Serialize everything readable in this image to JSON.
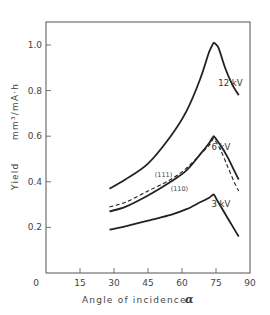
{
  "chart_data": {
    "type": "line",
    "title": "",
    "xlabel": "Angle of incidence",
    "xlabel_symbol": "α",
    "ylabel": "Yield",
    "ylabel_unit": "mm³/mA·h",
    "xlim": [
      0,
      90
    ],
    "ylim": [
      0,
      1.1
    ],
    "x_ticks": [
      "0",
      "15",
      "30",
      "45",
      "60",
      "75",
      "90"
    ],
    "y_ticks": [
      "0.2",
      "0.4",
      "0.6",
      "0.8",
      "1.0"
    ],
    "grid": false,
    "legend": "inline labels",
    "series": [
      {
        "name": "12 kV",
        "style": "solid",
        "x": [
          28,
          35,
          45,
          55,
          62,
          68,
          72,
          74,
          76,
          79,
          82,
          85
        ],
        "y": [
          0.37,
          0.41,
          0.48,
          0.6,
          0.71,
          0.85,
          0.97,
          1.01,
          0.99,
          0.9,
          0.83,
          0.78
        ]
      },
      {
        "name": "6 kV (110)",
        "style": "solid",
        "x": [
          28,
          35,
          45,
          55,
          62,
          68,
          72,
          74,
          77,
          80,
          83,
          85
        ],
        "y": [
          0.27,
          0.29,
          0.34,
          0.4,
          0.45,
          0.52,
          0.57,
          0.6,
          0.56,
          0.51,
          0.45,
          0.41
        ]
      },
      {
        "name": "6 kV (111)",
        "style": "dashed",
        "x": [
          28,
          35,
          45,
          55,
          62,
          68,
          72,
          74,
          77,
          80,
          83,
          85
        ],
        "y": [
          0.29,
          0.31,
          0.36,
          0.41,
          0.46,
          0.52,
          0.56,
          0.59,
          0.54,
          0.47,
          0.4,
          0.36
        ]
      },
      {
        "name": "3 kV",
        "style": "solid",
        "x": [
          28,
          35,
          45,
          55,
          62,
          68,
          72,
          74,
          76,
          79,
          82,
          85
        ],
        "y": [
          0.19,
          0.205,
          0.23,
          0.255,
          0.28,
          0.31,
          0.33,
          0.345,
          0.31,
          0.26,
          0.21,
          0.16
        ]
      }
    ],
    "annotations": [
      {
        "text": "12 kV",
        "x": 76,
        "y": 0.82
      },
      {
        "text": "6 kV",
        "x": 73,
        "y": 0.54
      },
      {
        "text": "3 kV",
        "x": 73,
        "y": 0.29
      },
      {
        "text": "(111)",
        "x": 48,
        "y": 0.42
      },
      {
        "text": "(110)",
        "x": 55,
        "y": 0.36
      }
    ]
  }
}
